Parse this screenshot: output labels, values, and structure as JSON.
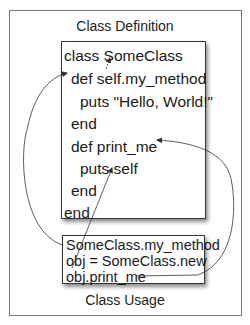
{
  "diagram": {
    "definition_caption": "Class Definition",
    "usage_caption": "Class Usage",
    "definition_lines": [
      {
        "text": "class SomeClass",
        "indent": 0
      },
      {
        "text": "def self.my_method",
        "indent": 1
      },
      {
        "text": "puts \"Hello, World!\"",
        "indent": 2
      },
      {
        "text": "end",
        "indent": 1
      },
      {
        "text": "def print_me",
        "indent": 1
      },
      {
        "text": "puts self",
        "indent": 2
      },
      {
        "text": "end",
        "indent": 1
      },
      {
        "text": "end",
        "indent": 0
      }
    ],
    "usage_lines": [
      {
        "text": "SomeClass.my_method"
      },
      {
        "text": "obj = SomeClass.new"
      },
      {
        "text": "obj.print_me"
      }
    ],
    "arrows": [
      {
        "from": "self (in def self.my_method)",
        "to": "SomeClass",
        "style": "dashed"
      },
      {
        "from": "SomeClass.my_method",
        "to": "def self.my_method",
        "style": "curve-left"
      },
      {
        "from": "obj.print_me",
        "to": "def print_me",
        "style": "curve-right"
      },
      {
        "from": "obj",
        "to": "self (in puts self)",
        "style": "straight"
      }
    ],
    "colors": {
      "frame": "#7a7a7a",
      "box_border": "#333333",
      "text": "#1a1a1a",
      "arrow": "#333333"
    }
  }
}
